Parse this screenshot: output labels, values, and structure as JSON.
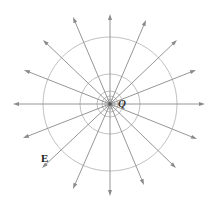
{
  "diagram": {
    "colors": {
      "ray": "#8a8a8a",
      "circle": "#b0b0b0",
      "charge": "#555555",
      "label": "#222222"
    },
    "charge": {
      "label": "Q",
      "cx": 110,
      "cy": 104
    },
    "field_label": {
      "text": "E",
      "x": 41,
      "y": 152
    },
    "equipotential_circles": [
      {
        "r": 67
      },
      {
        "r": 30
      },
      {
        "r": 13
      },
      {
        "r": 8
      },
      {
        "r": 5
      },
      {
        "r": 3
      }
    ],
    "field_lines": [
      {
        "angle_deg": 0,
        "tip": [
          205,
          104
        ]
      },
      {
        "angle_deg": 22.5,
        "tip": [
          196,
          70
        ]
      },
      {
        "angle_deg": 45,
        "tip": [
          177,
          40
        ]
      },
      {
        "angle_deg": 67.5,
        "tip": [
          146,
          20
        ]
      },
      {
        "angle_deg": 90,
        "tip": [
          110,
          14
        ]
      },
      {
        "angle_deg": 112.5,
        "tip": [
          73,
          17
        ]
      },
      {
        "angle_deg": 135,
        "tip": [
          43,
          40
        ]
      },
      {
        "angle_deg": 157.5,
        "tip": [
          24,
          70
        ]
      },
      {
        "angle_deg": 180,
        "tip": [
          13,
          104
        ]
      },
      {
        "angle_deg": 202.5,
        "tip": [
          23,
          138
        ]
      },
      {
        "angle_deg": 225,
        "tip": [
          42,
          168
        ]
      },
      {
        "angle_deg": 247.5,
        "tip": [
          73,
          189
        ]
      },
      {
        "angle_deg": 270,
        "tip": [
          110,
          196
        ]
      },
      {
        "angle_deg": 292.5,
        "tip": [
          144,
          185
        ]
      },
      {
        "angle_deg": 315,
        "tip": [
          176,
          168
        ]
      },
      {
        "angle_deg": 337.5,
        "tip": [
          197,
          139
        ]
      }
    ]
  }
}
